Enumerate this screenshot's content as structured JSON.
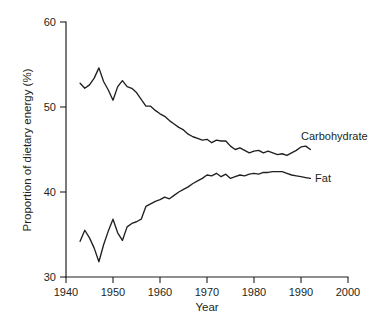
{
  "chart_data": {
    "type": "line",
    "title": "",
    "xlabel": "Year",
    "ylabel": "Proportion of dietary energy (%)",
    "xlim": [
      1940,
      2000
    ],
    "ylim": [
      30,
      60
    ],
    "xticks": [
      1940,
      1950,
      1960,
      1970,
      1980,
      1990,
      2000
    ],
    "xtick_labels": [
      "1940",
      "1950",
      "1960",
      "1970",
      "1980",
      "1990",
      "2000"
    ],
    "yticks": [
      30,
      40,
      50,
      60
    ],
    "ytick_labels": [
      "30",
      "40",
      "50",
      "60"
    ],
    "grid": false,
    "legend_position": "inline-right-of-series",
    "line_color": "#231f20",
    "background_color": "#ffffff",
    "series": [
      {
        "name": "Carbohydrate",
        "label_x": 1990,
        "label_y": 46.6,
        "x": [
          1943,
          1944,
          1945,
          1946,
          1947,
          1948,
          1949,
          1950,
          1951,
          1952,
          1953,
          1954,
          1955,
          1956,
          1957,
          1958,
          1959,
          1960,
          1961,
          1962,
          1963,
          1964,
          1965,
          1966,
          1967,
          1968,
          1969,
          1970,
          1971,
          1972,
          1973,
          1974,
          1975,
          1976,
          1977,
          1978,
          1979,
          1980,
          1981,
          1982,
          1983,
          1984,
          1985,
          1986,
          1987,
          1988,
          1989,
          1990,
          1991,
          1992
        ],
        "values": [
          52.8,
          52.2,
          52.6,
          53.4,
          54.6,
          53.0,
          52.0,
          50.8,
          52.4,
          53.1,
          52.4,
          52.2,
          51.7,
          50.9,
          50.1,
          50.1,
          49.6,
          49.2,
          48.9,
          48.4,
          48.0,
          47.6,
          47.3,
          46.8,
          46.5,
          46.3,
          46.1,
          46.2,
          45.8,
          46.1,
          46.0,
          46.0,
          45.4,
          45.0,
          45.2,
          44.9,
          44.6,
          44.8,
          44.9,
          44.6,
          44.8,
          44.6,
          44.4,
          44.5,
          44.3,
          44.6,
          44.9,
          45.3,
          45.4,
          45.0
        ]
      },
      {
        "name": "Fat",
        "label_x": 1993,
        "label_y": 41.6,
        "x": [
          1943,
          1944,
          1945,
          1946,
          1947,
          1948,
          1949,
          1950,
          1951,
          1952,
          1953,
          1954,
          1955,
          1956,
          1957,
          1958,
          1959,
          1960,
          1961,
          1962,
          1963,
          1964,
          1965,
          1966,
          1967,
          1968,
          1969,
          1970,
          1971,
          1972,
          1973,
          1974,
          1975,
          1976,
          1977,
          1978,
          1979,
          1980,
          1981,
          1982,
          1983,
          1984,
          1985,
          1986,
          1987,
          1988,
          1989,
          1990,
          1991,
          1992
        ],
        "values": [
          34.2,
          35.5,
          34.6,
          33.4,
          31.8,
          33.8,
          35.4,
          36.8,
          35.2,
          34.3,
          35.9,
          36.3,
          36.5,
          36.8,
          38.3,
          38.6,
          38.9,
          39.1,
          39.4,
          39.2,
          39.6,
          40.0,
          40.3,
          40.6,
          41.0,
          41.3,
          41.6,
          42.0,
          41.9,
          42.2,
          41.8,
          42.1,
          41.6,
          41.8,
          42.0,
          41.9,
          42.1,
          42.2,
          42.1,
          42.3,
          42.3,
          42.4,
          42.4,
          42.4,
          42.2,
          42.0,
          41.9,
          41.8,
          41.7,
          41.6
        ]
      }
    ]
  }
}
